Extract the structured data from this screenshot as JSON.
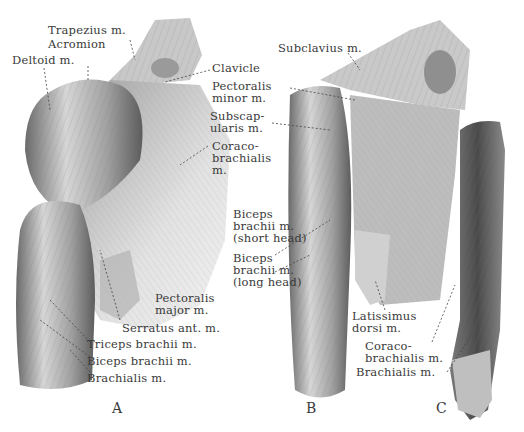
{
  "figure": {
    "panels": [
      {
        "id": "A",
        "label": "A"
      },
      {
        "id": "B",
        "label": "B"
      },
      {
        "id": "C",
        "label": "C"
      }
    ],
    "labels_a": {
      "trapezius": "Trapezius m.",
      "acromion": "Acromion",
      "deltoid": "Deltoid m.",
      "clavicle": "Clavicle",
      "pectoralis_minor_1": "Pectoralis",
      "pectoralis_minor_2": "minor m.",
      "subscapularis_1": "Subscap-",
      "subscapularis_2": "ularis m.",
      "coracobrachialis_1": "Coraco-",
      "coracobrachialis_2": "brachialis",
      "coracobrachialis_3": "m.",
      "biceps_short_1": "Biceps",
      "biceps_short_2": "brachii m.",
      "biceps_short_3": "(short head)",
      "biceps_long_1": "Biceps",
      "biceps_long_2": "brachii m.",
      "biceps_long_3": "(long head)",
      "pectoralis_major_1": "Pectoralis",
      "pectoralis_major_2": "major m.",
      "serratus": "Serratus ant. m.",
      "triceps": "Triceps brachii m.",
      "biceps": "Biceps brachii m.",
      "brachialis": "Brachialis m."
    },
    "labels_b": {
      "subclavius": "Subclavius m.",
      "latissimus_1": "Latissimus",
      "latissimus_2": "dorsi m."
    },
    "labels_c": {
      "coracobrachialis_1": "Coraco-",
      "coracobrachialis_2": "brachialis m.",
      "brachialis": "Brachialis m."
    },
    "colors": {
      "ink": "#3a3a3a",
      "muscle_light": "#d9d9d9",
      "muscle_mid": "#a8a8a8",
      "muscle_dark": "#5a5a5a",
      "background": "#ffffff"
    }
  }
}
